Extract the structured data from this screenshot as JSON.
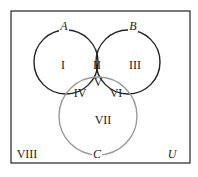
{
  "diagram": {
    "type": "venn-three-set",
    "universe_label": "U",
    "sets": [
      {
        "name": "A",
        "cx": 66,
        "cy": 62,
        "r": 32,
        "color": "#222222",
        "label_x": 64,
        "label_y": 30
      },
      {
        "name": "B",
        "cx": 128,
        "cy": 62,
        "r": 32,
        "color": "#222222",
        "label_x": 133,
        "label_y": 30
      },
      {
        "name": "C",
        "cx": 98,
        "cy": 116,
        "r": 39,
        "color": "#9a9a9a",
        "label_x": 97,
        "label_y": 158
      }
    ],
    "regions": [
      {
        "label": "I",
        "x": 63,
        "y": 69
      },
      {
        "label": "II",
        "x": 97,
        "y": 69
      },
      {
        "label": "III",
        "x": 135,
        "y": 69
      },
      {
        "label": "IV",
        "x": 80,
        "y": 97
      },
      {
        "label": "V",
        "x": 98,
        "y": 86
      },
      {
        "label": "VI",
        "x": 116,
        "y": 97
      },
      {
        "label": "VII",
        "x": 103,
        "y": 124
      },
      {
        "label": "VIII",
        "x": 27,
        "y": 158
      }
    ],
    "universe_label_pos": {
      "x": 172,
      "y": 158
    },
    "frame": {
      "x": 11,
      "y": 11,
      "w": 179,
      "h": 152,
      "color": "#333333"
    }
  }
}
